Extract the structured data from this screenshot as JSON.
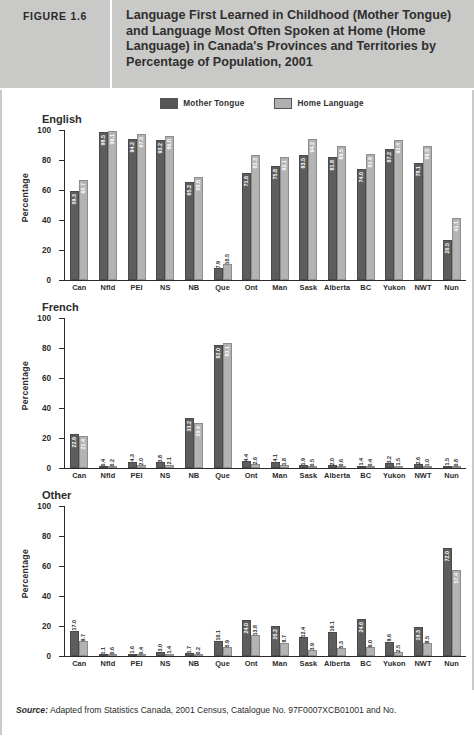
{
  "header": {
    "figure_number": "FIGURE 1.6",
    "title": "Language First Learned in Childhood (Mother Tongue) and Language Most Often Spoken at Home (Home Language) in Canada's Provinces and Territories by Percentage of Population, 2001"
  },
  "legend": {
    "items": [
      {
        "label": "Mother Tongue",
        "color": "#5d5d5d",
        "icon": "legend-swatch"
      },
      {
        "label": "Home Language",
        "color": "#b3b3b3",
        "icon": "legend-swatch"
      }
    ]
  },
  "axis": {
    "ylabel": "Percentage",
    "yticks": [
      "0",
      "20",
      "40",
      "60",
      "80",
      "100"
    ]
  },
  "footer": {
    "source_word": "Source:",
    "source_text": " Adapted from Statistics Canada, 2001 Census, Catalogue No. 97F0007XCB01001 and No."
  },
  "chart_data": [
    {
      "type": "bar",
      "title": "English",
      "xlabel": "",
      "ylabel": "Percentage",
      "ylim": [
        0,
        100
      ],
      "yticks": [
        0,
        20,
        40,
        60,
        80,
        100
      ],
      "grid": false,
      "legend_position": "top-center",
      "categories": [
        "Can",
        "Nfld",
        "PEI",
        "NS",
        "NB",
        "Que",
        "Ont",
        "Man",
        "Sask",
        "Alberta",
        "BC",
        "Yukon",
        "NWT",
        "Nun"
      ],
      "series": [
        {
          "name": "Mother Tongue",
          "values": [
            59.3,
            98.5,
            94.2,
            93.2,
            65.2,
            7.9,
            71.6,
            75.8,
            83.5,
            81.8,
            74.0,
            87.2,
            78.1,
            26.5
          ]
        },
        {
          "name": "Home Language",
          "values": [
            66.7,
            99.1,
            97.3,
            96.0,
            68.8,
            10.5,
            83.3,
            82.1,
            94.2,
            89.5,
            83.9,
            93.4,
            89.3,
            41.1
          ]
        }
      ]
    },
    {
      "type": "bar",
      "title": "French",
      "xlabel": "",
      "ylabel": "Percentage",
      "ylim": [
        0,
        100
      ],
      "yticks": [
        0,
        20,
        40,
        60,
        80,
        100
      ],
      "grid": false,
      "legend_position": "top-center",
      "categories": [
        "Can",
        "Nfld",
        "PEI",
        "NS",
        "NB",
        "Que",
        "Ont",
        "Man",
        "Sask",
        "Alberta",
        "BC",
        "Yukon",
        "NWT",
        "Nun"
      ],
      "series": [
        {
          "name": "Mother Tongue",
          "values": [
            22.9,
            0.4,
            4.3,
            3.8,
            33.2,
            82.0,
            4.4,
            4.1,
            1.9,
            2.0,
            1.4,
            3.2,
            2.6,
            1.5
          ]
        },
        {
          "name": "Home Language",
          "values": [
            21.4,
            0.2,
            2.0,
            2.1,
            29.9,
            83.1,
            2.6,
            1.8,
            0.5,
            0.6,
            0.4,
            1.5,
            1.0,
            0.8
          ]
        }
      ]
    },
    {
      "type": "bar",
      "title": "Other",
      "xlabel": "",
      "ylabel": "Percentage",
      "ylim": [
        0,
        100
      ],
      "yticks": [
        0,
        20,
        40,
        60,
        80,
        100
      ],
      "grid": false,
      "legend_position": "top-center",
      "categories": [
        "Can",
        "Nfld",
        "PEI",
        "NS",
        "NB",
        "Que",
        "Ont",
        "Man",
        "Sask",
        "Alberta",
        "BC",
        "Yukon",
        "NWT",
        "Nun"
      ],
      "series": [
        {
          "name": "Mother Tongue",
          "values": [
            17.0,
            1.1,
            1.6,
            3.0,
            1.7,
            10.1,
            24.0,
            20.2,
            12.4,
            16.1,
            24.6,
            9.6,
            19.3,
            72.0
          ]
        },
        {
          "name": "Home Language",
          "values": [
            9.7,
            0.6,
            0.4,
            1.4,
            0.2,
            5.9,
            13.8,
            8.7,
            3.9,
            5.3,
            6.0,
            2.5,
            8.5,
            57.4
          ]
        }
      ]
    }
  ]
}
